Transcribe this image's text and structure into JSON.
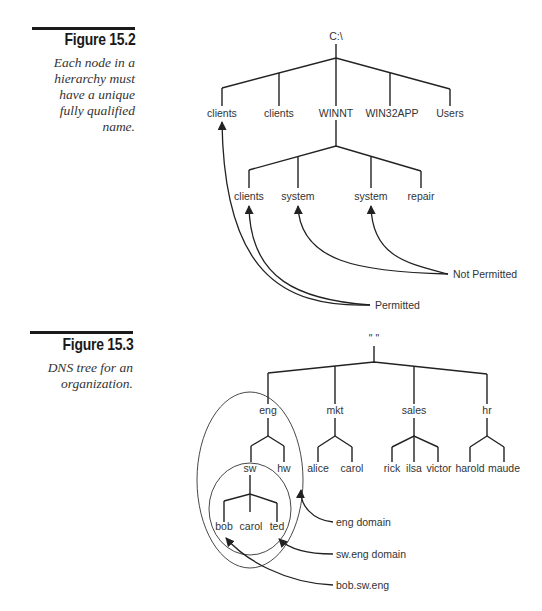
{
  "figures": [
    {
      "number": "Figure 15.2",
      "caption_lines": [
        "Each node in a",
        "hierarchy must",
        "have a unique",
        "fully qualified",
        "name."
      ],
      "tree": {
        "root": "C:\\",
        "level1": [
          "clients",
          "clients",
          "WINNT",
          "WIN32APP",
          "Users"
        ],
        "winnt_children": [
          "clients",
          "system",
          "system",
          "repair"
        ]
      },
      "callouts": {
        "not_permitted": "Not Permitted",
        "permitted": "Permitted"
      }
    },
    {
      "number": "Figure 15.3",
      "caption_lines": [
        "DNS tree for an",
        "organization."
      ],
      "tree": {
        "root": "\" \"",
        "level1": [
          "eng",
          "mkt",
          "sales",
          "hr"
        ],
        "eng_children": [
          "sw",
          "hw"
        ],
        "sw_children": [
          "bob",
          "carol",
          "ted"
        ],
        "mkt_children": [
          "alice",
          "carol"
        ],
        "sales_children": [
          "rick",
          "ilsa",
          "victor"
        ],
        "hr_children": [
          "harold",
          "maude"
        ]
      },
      "callouts": {
        "eng_domain": "eng domain",
        "sw_eng_domain": "sw.eng domain",
        "bob_fqdn": "bob.sw.eng"
      }
    }
  ],
  "colors": {
    "line": "#222222",
    "text": "#333333",
    "rule": "#1a1a1a"
  }
}
